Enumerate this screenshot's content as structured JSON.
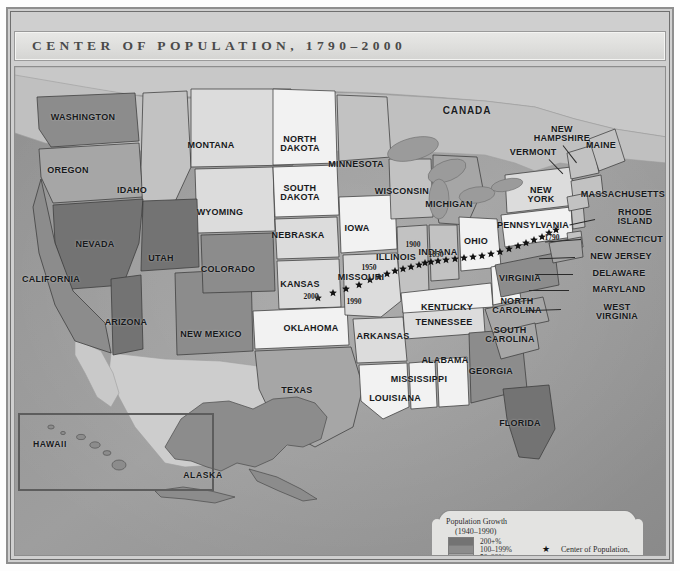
{
  "title": "CENTER OF POPULATION, 1790–2000",
  "country_label": "CANADA",
  "legend": {
    "title": "Population Growth",
    "subtitle": "(1940–1990)",
    "classes": [
      {
        "label": "200+%",
        "color": "#737373"
      },
      {
        "label": "100–199%",
        "color": "#8c8c8c"
      },
      {
        "label": "50–99%",
        "color": "#a6a6a6"
      },
      {
        "label": "25–49%",
        "color": "#c2c2c2"
      },
      {
        "label": "11–24%",
        "color": "#dcdcdc"
      },
      {
        "label": "1–10%",
        "color": "#f2f2f2"
      }
    ],
    "key_symbol": "★",
    "key_text": "Center of Population,\n1790–2000"
  },
  "year_markers": [
    {
      "label": "1790",
      "x": 537,
      "y": 170
    },
    {
      "label": "1850",
      "x": 421,
      "y": 187
    },
    {
      "label": "1900",
      "x": 398,
      "y": 177
    },
    {
      "label": "1950",
      "x": 354,
      "y": 200
    },
    {
      "label": "1990",
      "x": 339,
      "y": 234
    },
    {
      "label": "2000",
      "x": 296,
      "y": 229
    }
  ],
  "states": [
    {
      "name": "WASHINGTON",
      "x": 68,
      "y": 51,
      "class": "big"
    },
    {
      "name": "OREGON",
      "x": 53,
      "y": 104,
      "class": "big"
    },
    {
      "name": "IDAHO",
      "x": 117,
      "y": 124,
      "class": "big"
    },
    {
      "name": "MONTANA",
      "x": 196,
      "y": 79,
      "class": "big"
    },
    {
      "name": "WYOMING",
      "x": 205,
      "y": 146,
      "class": "big"
    },
    {
      "name": "NEVADA",
      "x": 80,
      "y": 178,
      "class": "big"
    },
    {
      "name": "UTAH",
      "x": 146,
      "y": 192,
      "class": "big"
    },
    {
      "name": "COLORADO",
      "x": 213,
      "y": 203,
      "class": "big"
    },
    {
      "name": "CALIFORNIA",
      "x": 36,
      "y": 213,
      "class": "big"
    },
    {
      "name": "ARIZONA",
      "x": 111,
      "y": 256,
      "class": "big"
    },
    {
      "name": "NEW MEXICO",
      "x": 196,
      "y": 268,
      "class": "big"
    },
    {
      "name": "TEXAS",
      "x": 282,
      "y": 324,
      "class": "big"
    },
    {
      "name": "NORTH\nDAKOTA",
      "x": 285,
      "y": 77,
      "class": "big"
    },
    {
      "name": "SOUTH\nDAKOTA",
      "x": 285,
      "y": 126,
      "class": "big"
    },
    {
      "name": "NEBRASKA",
      "x": 283,
      "y": 169,
      "class": "big"
    },
    {
      "name": "KANSAS",
      "x": 285,
      "y": 218,
      "class": "big"
    },
    {
      "name": "OKLAHOMA",
      "x": 296,
      "y": 262,
      "class": "big"
    },
    {
      "name": "MINNESOTA",
      "x": 341,
      "y": 98,
      "class": "big"
    },
    {
      "name": "IOWA",
      "x": 342,
      "y": 162,
      "class": "big"
    },
    {
      "name": "MISSOURI",
      "x": 346,
      "y": 211,
      "class": "big"
    },
    {
      "name": "ARKANSAS",
      "x": 368,
      "y": 270,
      "class": "big"
    },
    {
      "name": "LOUISIANA",
      "x": 380,
      "y": 332,
      "class": "big"
    },
    {
      "name": "WISCONSIN",
      "x": 387,
      "y": 125,
      "class": "big"
    },
    {
      "name": "ILLINOIS",
      "x": 381,
      "y": 191,
      "class": "big"
    },
    {
      "name": "MISSISSIPPI",
      "x": 404,
      "y": 313,
      "class": "big"
    },
    {
      "name": "MICHIGAN",
      "x": 434,
      "y": 138,
      "class": "big"
    },
    {
      "name": "INDIANA",
      "x": 423,
      "y": 186,
      "class": "big"
    },
    {
      "name": "KENTUCKY",
      "x": 432,
      "y": 241,
      "class": "big"
    },
    {
      "name": "TENNESSEE",
      "x": 429,
      "y": 256,
      "class": "big"
    },
    {
      "name": "ALABAMA",
      "x": 430,
      "y": 294,
      "class": "big"
    },
    {
      "name": "OHIO",
      "x": 461,
      "y": 175,
      "class": "big"
    },
    {
      "name": "GEORGIA",
      "x": 476,
      "y": 305,
      "class": "big"
    },
    {
      "name": "FLORIDA",
      "x": 505,
      "y": 357,
      "class": "big"
    },
    {
      "name": "SOUTH\nCAROLINA",
      "x": 495,
      "y": 268,
      "class": "big"
    },
    {
      "name": "NORTH\nCAROLINA",
      "x": 502,
      "y": 239,
      "class": "big"
    },
    {
      "name": "VIRGINIA",
      "x": 505,
      "y": 212,
      "class": "big"
    },
    {
      "name": "PENNSYLVANIA",
      "x": 518,
      "y": 159,
      "class": "big"
    },
    {
      "name": "NEW\nYORK",
      "x": 526,
      "y": 128,
      "class": "big"
    },
    {
      "name": "VERMONT",
      "x": 518,
      "y": 86,
      "class": "big"
    },
    {
      "name": "NEW\nHAMPSHIRE",
      "x": 547,
      "y": 67,
      "class": "big"
    },
    {
      "name": "MAINE",
      "x": 586,
      "y": 79,
      "class": "big"
    },
    {
      "name": "MASSACHUSETTS",
      "x": 608,
      "y": 128,
      "class": "big"
    },
    {
      "name": "RHODE\nISLAND",
      "x": 620,
      "y": 150,
      "class": "big"
    },
    {
      "name": "CONNECTICUT",
      "x": 614,
      "y": 173,
      "class": "big"
    },
    {
      "name": "NEW JERSEY",
      "x": 606,
      "y": 190,
      "class": "big"
    },
    {
      "name": "DELAWARE",
      "x": 604,
      "y": 207,
      "class": "big"
    },
    {
      "name": "MARYLAND",
      "x": 604,
      "y": 223,
      "class": "big"
    },
    {
      "name": "WEST\nVIRGINIA",
      "x": 602,
      "y": 245,
      "class": "big"
    }
  ],
  "insets": [
    {
      "name": "HAWAII",
      "x": 35,
      "y": 378
    },
    {
      "name": "ALASKA",
      "x": 188,
      "y": 409
    }
  ],
  "colors": {
    "ocean": "#9a9a9a",
    "land_outside": "#c9c9c9",
    "frame": "#8e8e8e",
    "title_bg": "#e3e3e1"
  }
}
